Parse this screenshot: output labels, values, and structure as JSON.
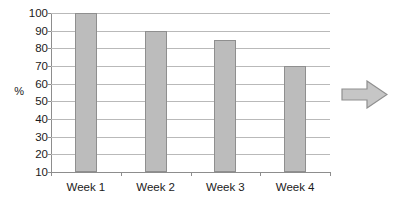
{
  "chart_data": {
    "type": "bar",
    "title": "",
    "subtitle": "",
    "xlabel": "",
    "ylabel": "%",
    "categories": [
      "Week 1",
      "Week 2",
      "Week 3",
      "Week 4"
    ],
    "values": [
      100,
      90,
      85,
      70
    ],
    "series": [
      {
        "name": "",
        "values": [
          100,
          90,
          85,
          70
        ]
      }
    ],
    "ylim": [
      10,
      100
    ],
    "y_ticks": [
      100,
      90,
      80,
      70,
      60,
      50,
      40,
      30,
      20,
      10
    ],
    "y_tick_labels": [
      "100",
      "90",
      "80",
      "70",
      "60",
      "50",
      "40",
      "30",
      "20",
      "10"
    ],
    "grid": true,
    "legend": false,
    "legend_position": "none",
    "annotations": [
      {
        "name": "right-arrow",
        "label": ""
      }
    ]
  },
  "colors": {
    "background": "#ffffff",
    "bar_fill": "#bcbcbc",
    "bar_stroke": "#8f8f8f",
    "gridline": "#b9b9b9",
    "axis": "#8d8d8d",
    "text": "#1a1a1a",
    "arrow_fill": "#c6c6c6",
    "arrow_stroke": "#8f8f8f"
  }
}
